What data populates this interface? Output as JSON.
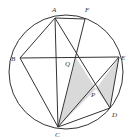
{
  "diagram": {
    "type": "circle-geometry",
    "circle": {
      "cx": 66,
      "cy": 72,
      "r": 57
    },
    "points": {
      "A": {
        "x": 55,
        "y": 18,
        "label": "A",
        "lx": 52,
        "ly": 12
      },
      "F": {
        "x": 85,
        "y": 19,
        "label": "F",
        "lx": 85,
        "ly": 12
      },
      "B": {
        "x": 20,
        "y": 58,
        "label": "B",
        "lx": 11,
        "ly": 61
      },
      "E": {
        "x": 119,
        "y": 57,
        "label": "E",
        "lx": 121,
        "ly": 60
      },
      "Q": {
        "x": 76,
        "y": 58,
        "label": "Q",
        "lx": 65,
        "ly": 66
      },
      "P": {
        "x": 96,
        "y": 89,
        "label": "P",
        "lx": 91,
        "ly": 97
      },
      "D": {
        "x": 110,
        "y": 108,
        "label": "D",
        "lx": 112,
        "ly": 117
      },
      "C": {
        "x": 58,
        "y": 127,
        "label": "C",
        "lx": 55,
        "ly": 137
      }
    },
    "labels": {
      "A": "A",
      "F": "F",
      "B": "B",
      "E": "E",
      "Q": "Q",
      "P": "P",
      "D": "D",
      "C": "C"
    },
    "segments": [
      [
        "A",
        "F"
      ],
      [
        "A",
        "B"
      ],
      [
        "A",
        "C"
      ],
      [
        "A",
        "D"
      ],
      [
        "F",
        "C"
      ],
      [
        "B",
        "E"
      ],
      [
        "B",
        "C"
      ],
      [
        "E",
        "C"
      ],
      [
        "E",
        "D"
      ],
      [
        "C",
        "D"
      ]
    ],
    "shaded_regions": [
      [
        "Q",
        "C",
        "P"
      ],
      [
        "P",
        "E",
        "D"
      ]
    ],
    "colors": {
      "stroke": "#333333",
      "shade": "#d9d9d9",
      "background": "#ffffff"
    }
  }
}
